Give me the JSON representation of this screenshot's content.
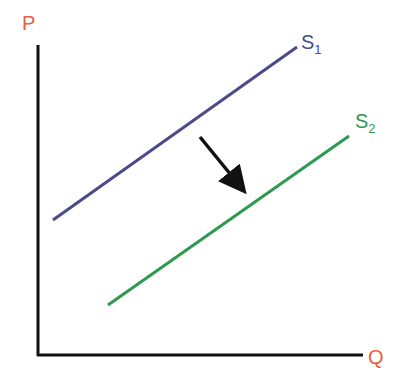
{
  "diagram": {
    "type": "supply-shift",
    "axes": {
      "y_label": "P",
      "x_label": "Q",
      "label_color": "#e8603c",
      "axis_color": "#111111"
    },
    "curves": [
      {
        "name": "S",
        "sub": "1",
        "color": "#4b4a8a",
        "from": [
          53,
          220
        ],
        "to": [
          297,
          47
        ]
      },
      {
        "name": "S",
        "sub": "2",
        "color": "#2e9a4f",
        "from": [
          108,
          305
        ],
        "to": [
          349,
          136
        ]
      }
    ],
    "arrow": {
      "from": [
        200,
        137
      ],
      "to": [
        243,
        190
      ],
      "color": "#111111",
      "meaning": "supply shifts right/down"
    }
  }
}
